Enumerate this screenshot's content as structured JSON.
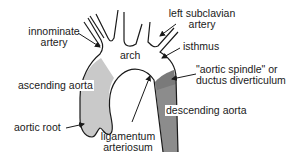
{
  "diagram": {
    "colors": {
      "outline": "#1a1a1a",
      "ascending_fill": "#c9c9c9",
      "descending_fill": "#8c8c8c",
      "spindle_fill": "#7a7a7a",
      "background": "#ffffff"
    },
    "labels": {
      "innominate_line1": "innominate",
      "innominate_line2": "artery",
      "left_subclavian_line1": "left subclavian",
      "left_subclavian_line2": "artery",
      "arch": "arch",
      "isthmus": "isthmus",
      "spindle_line1": "\"aortic spindle\" or",
      "spindle_line2": "ductus diverticulum",
      "ascending_aorta": "ascending aorta",
      "descending_aorta": "descending aorta",
      "aortic_root": "aortic root",
      "ligamentum_line1": "ligamentum",
      "ligamentum_line2": "arteriosum"
    }
  }
}
